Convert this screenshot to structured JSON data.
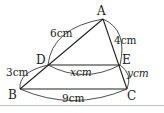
{
  "diagram": {
    "type": "triangle-parallel-line",
    "points": {
      "A": {
        "label": "A",
        "x": 103,
        "y": 19
      },
      "B": {
        "label": "B",
        "x": 20,
        "y": 89
      },
      "C": {
        "label": "C",
        "x": 127,
        "y": 89
      },
      "D": {
        "label": "D",
        "x": 48,
        "y": 65
      },
      "E": {
        "label": "E",
        "x": 120,
        "y": 65
      }
    },
    "segments": [
      {
        "from": "A",
        "to": "B"
      },
      {
        "from": "A",
        "to": "C"
      },
      {
        "from": "B",
        "to": "C"
      },
      {
        "from": "D",
        "to": "E"
      }
    ],
    "measurements": {
      "AD": "6cm",
      "DB": "3cm",
      "AE": "4cm",
      "EC": "ycm",
      "DE": "xcm",
      "BC": "9cm"
    },
    "colors": {
      "line": "#222222",
      "divider": "#bdbdbd"
    }
  }
}
